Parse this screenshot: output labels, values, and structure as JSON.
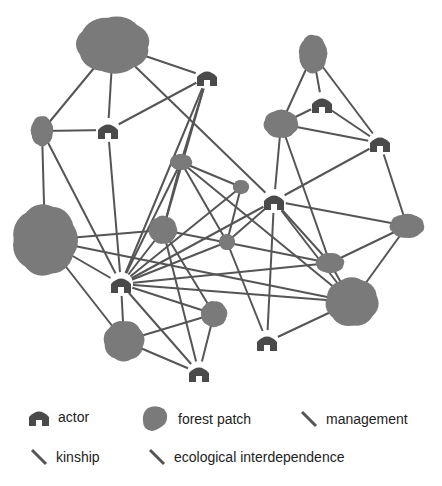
{
  "diagram": {
    "colors": {
      "edge": "#555555",
      "actor": "#4a4a4a",
      "forest": "#7a7a7a",
      "background": "#ffffff"
    },
    "actors": [
      {
        "id": "A1",
        "x": 207,
        "y": 77
      },
      {
        "id": "A2",
        "x": 108,
        "y": 130
      },
      {
        "id": "A3",
        "x": 322,
        "y": 104
      },
      {
        "id": "A4",
        "x": 380,
        "y": 143
      },
      {
        "id": "A5",
        "x": 274,
        "y": 201
      },
      {
        "id": "A6",
        "x": 121,
        "y": 284
      },
      {
        "id": "A7",
        "x": 267,
        "y": 342
      },
      {
        "id": "A8",
        "x": 199,
        "y": 373
      }
    ],
    "forests": [
      {
        "id": "F1",
        "x": 113,
        "y": 45,
        "rx": 36,
        "ry": 28
      },
      {
        "id": "F2",
        "x": 42,
        "y": 131,
        "rx": 11,
        "ry": 15
      },
      {
        "id": "F3",
        "x": 313,
        "y": 54,
        "rx": 14,
        "ry": 19
      },
      {
        "id": "F4",
        "x": 281,
        "y": 124,
        "rx": 17,
        "ry": 14
      },
      {
        "id": "F5",
        "x": 181,
        "y": 162,
        "rx": 11,
        "ry": 8
      },
      {
        "id": "F6",
        "x": 241,
        "y": 187,
        "rx": 8,
        "ry": 7
      },
      {
        "id": "F7",
        "x": 163,
        "y": 230,
        "rx": 14,
        "ry": 14
      },
      {
        "id": "F8",
        "x": 227,
        "y": 242,
        "rx": 8,
        "ry": 8
      },
      {
        "id": "F9",
        "x": 407,
        "y": 226,
        "rx": 17,
        "ry": 12
      },
      {
        "id": "F10",
        "x": 330,
        "y": 263,
        "rx": 14,
        "ry": 10
      },
      {
        "id": "F11",
        "x": 45,
        "y": 240,
        "rx": 32,
        "ry": 35
      },
      {
        "id": "F12",
        "x": 214,
        "y": 314,
        "rx": 13,
        "ry": 13
      },
      {
        "id": "F13",
        "x": 352,
        "y": 302,
        "rx": 26,
        "ry": 24
      },
      {
        "id": "F14",
        "x": 124,
        "y": 341,
        "rx": 20,
        "ry": 20
      }
    ],
    "edges": [
      [
        "F1",
        "A1"
      ],
      [
        "F1",
        "A2"
      ],
      [
        "F1",
        "F2"
      ],
      [
        "F1",
        "A5"
      ],
      [
        "A1",
        "A2"
      ],
      [
        "A1",
        "F7"
      ],
      [
        "A1",
        "F5"
      ],
      [
        "A1",
        "A6"
      ],
      [
        "F2",
        "A2"
      ],
      [
        "F2",
        "A6"
      ],
      [
        "F2",
        "F11"
      ],
      [
        "A2",
        "A6"
      ],
      [
        "F3",
        "A3"
      ],
      [
        "F3",
        "F4"
      ],
      [
        "F3",
        "A4"
      ],
      [
        "A3",
        "F4"
      ],
      [
        "A3",
        "A4"
      ],
      [
        "F4",
        "A4"
      ],
      [
        "F4",
        "A5"
      ],
      [
        "F4",
        "F10"
      ],
      [
        "A4",
        "A5"
      ],
      [
        "A4",
        "F9"
      ],
      [
        "F5",
        "F6"
      ],
      [
        "F5",
        "A6"
      ],
      [
        "F5",
        "F7"
      ],
      [
        "F5",
        "F8"
      ],
      [
        "F5",
        "F13"
      ],
      [
        "F6",
        "A6"
      ],
      [
        "F6",
        "F8"
      ],
      [
        "A5",
        "A6"
      ],
      [
        "A5",
        "F9"
      ],
      [
        "A5",
        "F10"
      ],
      [
        "A5",
        "F13"
      ],
      [
        "A5",
        "A7"
      ],
      [
        "A5",
        "F8"
      ],
      [
        "F7",
        "F11"
      ],
      [
        "F7",
        "A6"
      ],
      [
        "F7",
        "A8"
      ],
      [
        "F7",
        "F12"
      ],
      [
        "F7",
        "F10"
      ],
      [
        "F8",
        "A6"
      ],
      [
        "F8",
        "A7"
      ],
      [
        "F9",
        "F10"
      ],
      [
        "F9",
        "F13"
      ],
      [
        "F10",
        "A6"
      ],
      [
        "F10",
        "F13"
      ],
      [
        "F11",
        "A6"
      ],
      [
        "F11",
        "F14"
      ],
      [
        "F11",
        "F13"
      ],
      [
        "A6",
        "F13"
      ],
      [
        "A6",
        "F12"
      ],
      [
        "A6",
        "F14"
      ],
      [
        "A6",
        "A8"
      ],
      [
        "F12",
        "F14"
      ],
      [
        "F12",
        "A8"
      ],
      [
        "F13",
        "A7"
      ],
      [
        "F14",
        "A8"
      ]
    ]
  },
  "legend": {
    "actor": "actor",
    "forest_patch": "forest patch",
    "management": "management",
    "kinship": "kinship",
    "ecological": "ecological interdependence"
  }
}
